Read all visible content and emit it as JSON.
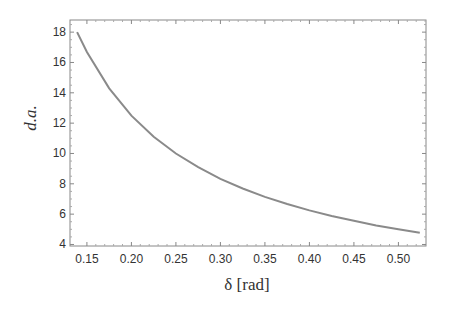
{
  "chart_data": {
    "type": "line",
    "title": "",
    "xlabel": "δ [rad]",
    "ylabel": "d.a.",
    "xlim": [
      0.131,
      0.531
    ],
    "ylim": [
      3.9,
      18.8
    ],
    "xticks": [
      0.15,
      0.2,
      0.25,
      0.3,
      0.35,
      0.4,
      0.45,
      0.5
    ],
    "xtick_labels": [
      "0.15",
      "0.20",
      "0.25",
      "0.30",
      "0.35",
      "0.40",
      "0.45",
      "0.50"
    ],
    "yticks": [
      4,
      6,
      8,
      10,
      12,
      14,
      16,
      18
    ],
    "ytick_labels": [
      "4",
      "6",
      "8",
      "10",
      "12",
      "14",
      "16",
      "18"
    ],
    "grid": false,
    "legend": null,
    "frame": true,
    "series": [
      {
        "name": "d.a.",
        "color": "#8a8a8a",
        "x": [
          0.139,
          0.15,
          0.175,
          0.2,
          0.225,
          0.25,
          0.275,
          0.3,
          0.325,
          0.35,
          0.375,
          0.4,
          0.425,
          0.45,
          0.475,
          0.5,
          0.524
        ],
        "y": [
          18.0,
          16.7,
          14.3,
          12.5,
          11.1,
          10.0,
          9.1,
          8.33,
          7.69,
          7.14,
          6.67,
          6.25,
          5.88,
          5.56,
          5.26,
          5.0,
          4.77
        ]
      }
    ]
  }
}
